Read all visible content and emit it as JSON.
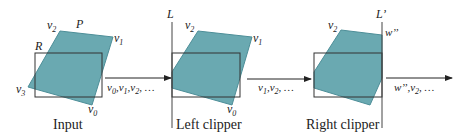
{
  "colors": {
    "polygon_fill": "#6aa9b1",
    "polygon_stroke": "#4d8e98",
    "line": "#333333",
    "text": "#222222"
  },
  "panels": [
    {
      "caption": "Input",
      "polygon_label": "P",
      "rect_label": "R",
      "vertices": {
        "v0": "v",
        "v0_sub": "0",
        "v1": "v",
        "v1_sub": "1",
        "v2": "v",
        "v2_sub": "2",
        "v3": "v",
        "v3_sub": "3"
      }
    },
    {
      "caption": "Left clipper",
      "clip_line_label": "L",
      "vertices": {
        "v0": "v",
        "v0_sub": "0",
        "v1": "v",
        "v1_sub": "1",
        "v2": "v",
        "v2_sub": "2"
      }
    },
    {
      "caption": "Right clipper",
      "clip_line_label": "L’",
      "vertices": {
        "v2": "v",
        "v2_sub": "2",
        "w": "w’’"
      }
    }
  ],
  "arrows": [
    {
      "label_parts": [
        "v",
        "0",
        ",v",
        "1",
        ",v",
        "2",
        ", …"
      ]
    },
    {
      "label_parts": [
        "v",
        "1",
        ",v",
        "2",
        ", …"
      ]
    },
    {
      "label_parts": [
        "w’’",
        ",v",
        "2",
        ", …"
      ]
    }
  ]
}
